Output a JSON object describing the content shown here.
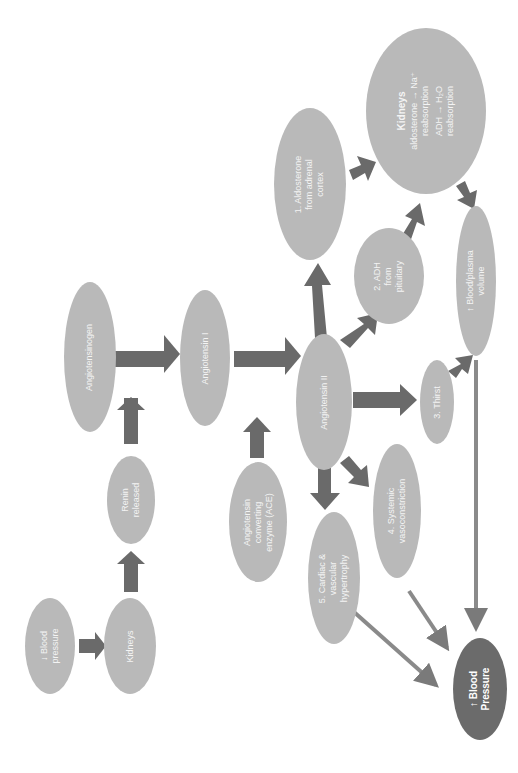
{
  "diagram": {
    "title": "",
    "orientation": "rotated-90-ccw",
    "colors": {
      "node_fill": "#b9b9b9",
      "node_dark_fill": "#6b6b6b",
      "arrow": "#6a6a6a",
      "thin_arrow": "#8a8a8a",
      "text": "#f4f4f4"
    },
    "nodes": {
      "bp_low": {
        "line1": "↓ Blood",
        "line2": "pressure"
      },
      "kidneys_left": {
        "line1": "Kidneys"
      },
      "renin": {
        "line1": "Renin",
        "line2": "released"
      },
      "angiotensinogen": {
        "line1": "Angiotensinogen"
      },
      "angiotensin1": {
        "line1": "Angiotensin I"
      },
      "ace": {
        "line1": "Angiotensin",
        "line2": "converting",
        "line3": "enzyme (ACE)"
      },
      "angiotensin2": {
        "line1": "Angiotensin II"
      },
      "aldosterone": {
        "line1": "1. Aldosterone",
        "line2": "from adrenal",
        "line3": "cortex"
      },
      "adh": {
        "line1": "2. ADH",
        "line2": "from",
        "line3": "pituitary"
      },
      "kidneys_right": {
        "title": "Kidneys",
        "line1": "aldosterone → Na⁺",
        "line2": "reabsorption",
        "line3": "ADH → H₂O",
        "line4": "reabsorption"
      },
      "plasma_volume": {
        "line1": "↑ Blood/plasma",
        "line2": "volume"
      },
      "thirst": {
        "line1": "3. Thirst"
      },
      "vasoconstriction": {
        "line1": "4. Systemic",
        "line2": "vasoconstriction"
      },
      "hypertrophy": {
        "line1": "5. Cardiac &",
        "line2": "vascular",
        "line3": "hypertrophy"
      },
      "bp_high": {
        "line1": "↑ Blood",
        "line2": "Pressure"
      }
    },
    "edges": [
      [
        "bp_low",
        "kidneys_left"
      ],
      [
        "kidneys_left",
        "renin"
      ],
      [
        "renin",
        "angiotensin1 (acts on angiotensinogen)"
      ],
      [
        "angiotensinogen",
        "angiotensin1"
      ],
      [
        "angiotensin1",
        "angiotensin2"
      ],
      [
        "ace",
        "angiotensin1→angiotensin2"
      ],
      [
        "angiotensin2",
        "aldosterone"
      ],
      [
        "angiotensin2",
        "adh"
      ],
      [
        "angiotensin2",
        "thirst"
      ],
      [
        "angiotensin2",
        "vasoconstriction"
      ],
      [
        "angiotensin2",
        "hypertrophy"
      ],
      [
        "aldosterone",
        "kidneys_right"
      ],
      [
        "adh",
        "kidneys_right"
      ],
      [
        "kidneys_right",
        "plasma_volume"
      ],
      [
        "thirst",
        "plasma_volume"
      ],
      [
        "plasma_volume",
        "bp_high"
      ],
      [
        "vasoconstriction",
        "bp_high"
      ],
      [
        "hypertrophy",
        "bp_high"
      ]
    ]
  }
}
